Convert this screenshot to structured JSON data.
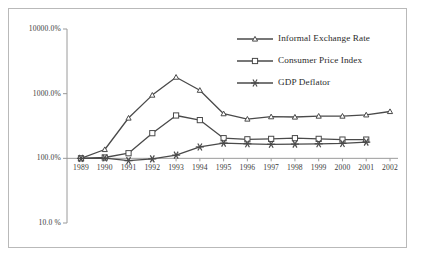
{
  "chart_data": {
    "type": "line",
    "title": "",
    "xlabel": "",
    "ylabel": "",
    "log_scale_y": true,
    "ylim": [
      10,
      10000
    ],
    "y_tick_labels": [
      "10000.0%",
      "1000.0%",
      "100.0%",
      "10.0 %"
    ],
    "y_tick_values": [
      10000,
      1000,
      100,
      10
    ],
    "grid": false,
    "legend_position": "top-right",
    "categories": [
      "1989",
      "1990",
      "1991",
      "1992",
      "1993",
      "1994",
      "1995",
      "1996",
      "1997",
      "1998",
      "1999",
      "2000",
      "2001",
      "2002"
    ],
    "x": [
      1989,
      1990,
      1991,
      1992,
      1993,
      1994,
      1995,
      1996,
      1997,
      1998,
      1999,
      2000,
      2001,
      2002
    ],
    "series": [
      {
        "name": "Informal Exchange Rate",
        "marker": "open-triangle",
        "values": [
          100,
          137,
          420,
          950,
          1800,
          1130,
          490,
          405,
          440,
          435,
          450,
          450,
          470,
          530
        ]
      },
      {
        "name": "Consumer Price Index",
        "marker": "open-square",
        "values": [
          100,
          103,
          120,
          245,
          460,
          390,
          205,
          197,
          200,
          205,
          200,
          195,
          195,
          null
        ]
      },
      {
        "name": "GDP Deflator",
        "marker": "asterisk",
        "values": [
          100,
          101,
          92,
          98,
          112,
          150,
          172,
          168,
          165,
          166,
          168,
          170,
          178,
          null
        ]
      }
    ]
  },
  "legend": {
    "items": [
      {
        "label": "Informal Exchange Rate",
        "marker": "open-triangle"
      },
      {
        "label": "Consumer Price Index",
        "marker": "open-square"
      },
      {
        "label": "GDP Deflator",
        "marker": "asterisk"
      }
    ]
  },
  "axes": {
    "y_labels": [
      "10000.0%",
      "1000.0%",
      "100.0%",
      "10.0 %"
    ],
    "x_labels": [
      "1989",
      "1990",
      "1991",
      "1992",
      "1993",
      "1994",
      "1995",
      "1996",
      "1997",
      "1998",
      "1999",
      "2000",
      "2001",
      "2002"
    ]
  },
  "colors": {
    "line": "#4a4a4a",
    "axis": "#9a9a9a",
    "text": "#2b2b2b",
    "frame": "#b9b9b9",
    "background": "#ffffff"
  }
}
